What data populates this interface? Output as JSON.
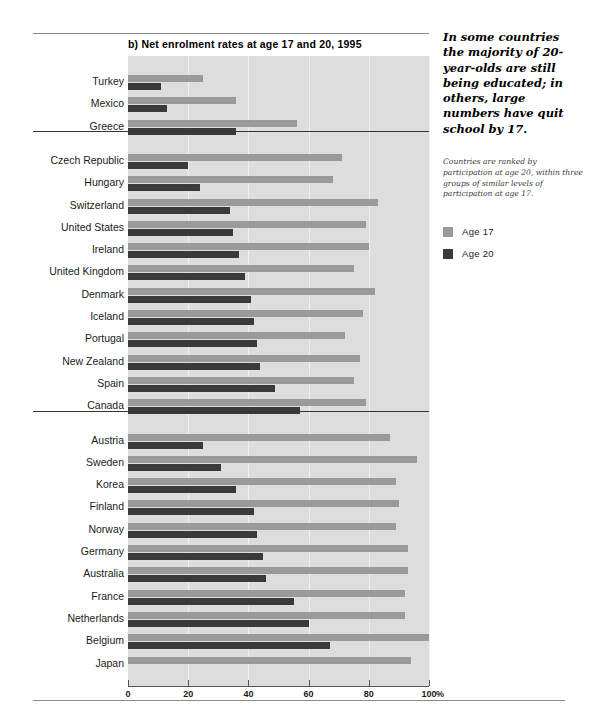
{
  "chart_title": "b) Net enrolment rates at age 17 and 20, 1995",
  "sidebar": {
    "headline": "In some countries the majority of 20-year-olds are still being educated; in others, large numbers have quit school by 17.",
    "note": "Countries are ranked by participation at age 20, within three groups of similar levels of participation at age 17.",
    "legend": [
      {
        "label": "Age 17",
        "color": "#9a9a9a"
      },
      {
        "label": "Age 20",
        "color": "#3a3a3a"
      }
    ]
  },
  "axis": {
    "unit": "%",
    "ticks": [
      "0",
      "20",
      "40",
      "60",
      "80",
      "100"
    ]
  },
  "chart_data": {
    "type": "bar",
    "orientation": "horizontal",
    "title": "b) Net enrolment rates at age 17 and 20, 1995",
    "xlabel": "%",
    "ylabel": "",
    "xlim": [
      0,
      100
    ],
    "xticks": [
      0,
      20,
      40,
      60,
      80,
      100
    ],
    "grid": true,
    "legend_position": "right",
    "categories": [
      "Turkey",
      "Mexico",
      "Greece",
      "Czech Republic",
      "Hungary",
      "Switzerland",
      "United States",
      "Ireland",
      "United Kingdom",
      "Denmark",
      "Iceland",
      "Portugal",
      "New Zealand",
      "Spain",
      "Canada",
      "Austria",
      "Sweden",
      "Korea",
      "Finland",
      "Norway",
      "Germany",
      "Australia",
      "France",
      "Netherlands",
      "Belgium",
      "Japan"
    ],
    "series": [
      {
        "name": "Age 17",
        "color": "#9a9a9a",
        "values": [
          25,
          36,
          56,
          71,
          68,
          83,
          79,
          80,
          75,
          82,
          78,
          72,
          77,
          75,
          79,
          87,
          96,
          89,
          90,
          89,
          93,
          93,
          92,
          92,
          100,
          94
        ]
      },
      {
        "name": "Age 20",
        "color": "#3a3a3a",
        "values": [
          11,
          13,
          36,
          20,
          24,
          34,
          35,
          37,
          39,
          41,
          42,
          43,
          44,
          49,
          57,
          25,
          31,
          36,
          42,
          43,
          45,
          46,
          55,
          60,
          67,
          null
        ]
      }
    ],
    "groups": [
      {
        "name": "group-1",
        "start": 0,
        "count": 3
      },
      {
        "name": "group-2",
        "start": 3,
        "count": 12
      },
      {
        "name": "group-3",
        "start": 15,
        "count": 11
      }
    ]
  }
}
